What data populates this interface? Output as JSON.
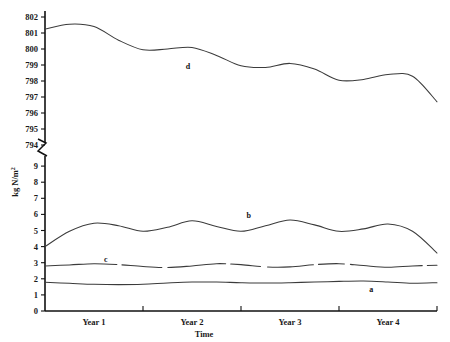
{
  "chart_data": {
    "type": "line",
    "title": "",
    "xlabel": "Time",
    "ylabel": "kg N/m2",
    "ylabel_display": "kg N/m",
    "ylabel_superscript": "2",
    "grid": false,
    "legend": "inline-labels",
    "axis_break": true,
    "x_tick_labels": [
      "Year 1",
      "Year 2",
      "Year 3",
      "Year 4"
    ],
    "x_range": [
      0,
      4
    ],
    "y_axis_lower": {
      "ticks": [
        0,
        1,
        2,
        3,
        4,
        5,
        6,
        7,
        8,
        9
      ],
      "tick_labels": [
        "0",
        "1",
        "2",
        "3",
        "4",
        "5",
        "6",
        "7",
        "8",
        "9"
      ],
      "range": [
        0,
        9
      ]
    },
    "y_axis_upper": {
      "ticks": [
        794,
        795,
        796,
        797,
        798,
        799,
        800,
        801,
        802
      ],
      "tick_labels": [
        "794",
        "795",
        "796",
        "797",
        "798",
        "799",
        "800",
        "801",
        "802"
      ],
      "range": [
        794,
        802
      ]
    },
    "series": [
      {
        "name": "a",
        "label": "a",
        "axis": "lower",
        "style": "solid",
        "label_x": 3.33,
        "label_y": 1.35,
        "x": [
          0.0,
          0.25,
          0.5,
          0.75,
          1.0,
          1.25,
          1.5,
          1.75,
          2.0,
          2.25,
          2.5,
          2.75,
          3.0,
          3.25,
          3.5,
          3.75,
          4.0
        ],
        "values": [
          1.78,
          1.72,
          1.66,
          1.64,
          1.66,
          1.74,
          1.8,
          1.8,
          1.76,
          1.74,
          1.76,
          1.8,
          1.84,
          1.86,
          1.8,
          1.72,
          1.76
        ]
      },
      {
        "name": "c",
        "label": "c",
        "axis": "lower",
        "style": "dashed-gaps",
        "label_x": 0.62,
        "label_y": 3.22,
        "x": [
          0.0,
          0.25,
          0.5,
          0.75,
          1.0,
          1.25,
          1.5,
          1.75,
          2.0,
          2.25,
          2.5,
          2.75,
          3.0,
          3.25,
          3.5,
          3.75,
          4.0
        ],
        "values": [
          2.8,
          2.86,
          2.94,
          2.88,
          2.76,
          2.7,
          2.8,
          2.94,
          2.88,
          2.74,
          2.74,
          2.88,
          2.94,
          2.82,
          2.72,
          2.8,
          2.84
        ]
      },
      {
        "name": "b",
        "label": "b",
        "axis": "lower",
        "style": "solid",
        "label_x": 2.08,
        "label_y": 5.95,
        "x": [
          0.0,
          0.25,
          0.5,
          0.75,
          1.0,
          1.25,
          1.5,
          1.75,
          2.0,
          2.25,
          2.5,
          2.75,
          3.0,
          3.25,
          3.5,
          3.75,
          4.0
        ],
        "values": [
          4.0,
          4.95,
          5.45,
          5.3,
          4.95,
          5.2,
          5.6,
          5.25,
          4.95,
          5.3,
          5.65,
          5.35,
          4.95,
          5.1,
          5.4,
          4.95,
          3.6
        ]
      },
      {
        "name": "d",
        "label": "d",
        "axis": "upper",
        "style": "solid",
        "label_x": 1.46,
        "label_y": 798.95,
        "x": [
          0.0,
          0.25,
          0.5,
          0.75,
          1.0,
          1.25,
          1.5,
          1.75,
          2.0,
          2.25,
          2.5,
          2.75,
          3.0,
          3.25,
          3.5,
          3.75,
          4.0
        ],
        "values": [
          801.25,
          801.55,
          801.4,
          800.55,
          799.95,
          800.0,
          800.1,
          799.6,
          798.95,
          798.85,
          799.1,
          798.75,
          798.05,
          798.1,
          798.4,
          798.3,
          796.7
        ]
      }
    ]
  }
}
